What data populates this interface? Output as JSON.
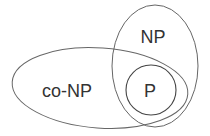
{
  "diagram": {
    "type": "venn",
    "sets": [
      {
        "id": "co-np",
        "label": "co-NP"
      },
      {
        "id": "np",
        "label": "NP"
      },
      {
        "id": "p",
        "label": "P"
      }
    ]
  },
  "colors": {
    "stroke": "#555555",
    "text": "#333333",
    "background": "#ffffff"
  }
}
